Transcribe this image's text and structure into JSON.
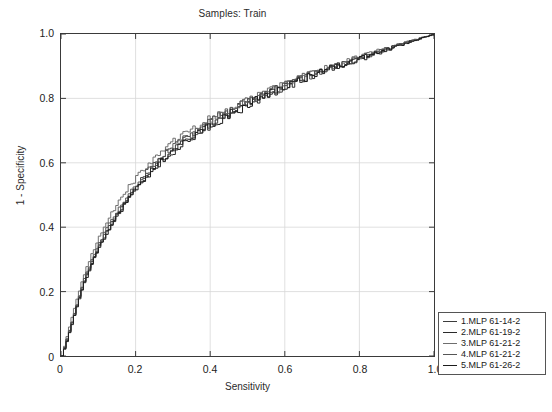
{
  "chart_data": {
    "type": "line",
    "title": "Samples: Train",
    "xlabel": "Sensitivity",
    "ylabel": "1 - Specificity",
    "xlim": [
      0,
      1
    ],
    "ylim": [
      0,
      1
    ],
    "grid": true,
    "legend_position": "right-bottom-outside",
    "xticks": [
      "0",
      "0.2",
      "0.4",
      "0.6",
      "0.8",
      "1.0"
    ],
    "xtick_values": [
      0,
      0.2,
      0.4,
      0.6,
      0.8,
      1.0
    ],
    "yticks": [
      "0",
      "0.2",
      "0.4",
      "0.6",
      "0.8",
      "1.0"
    ],
    "ytick_values": [
      0,
      0.2,
      0.4,
      0.6,
      0.8,
      1.0
    ],
    "x": [
      0,
      0.01,
      0.02,
      0.03,
      0.04,
      0.05,
      0.06,
      0.08,
      0.1,
      0.12,
      0.14,
      0.16,
      0.18,
      0.2,
      0.24,
      0.28,
      0.32,
      0.36,
      0.4,
      0.45,
      0.5,
      0.55,
      0.6,
      0.65,
      0.7,
      0.75,
      0.8,
      0.85,
      0.9,
      0.95,
      1.0
    ],
    "series": [
      {
        "name": "1.MLP 61-14-2",
        "color": "#3c3c3c",
        "values": [
          0,
          0.04,
          0.08,
          0.12,
          0.16,
          0.2,
          0.235,
          0.295,
          0.345,
          0.39,
          0.43,
          0.465,
          0.5,
          0.53,
          0.585,
          0.63,
          0.665,
          0.695,
          0.725,
          0.76,
          0.79,
          0.815,
          0.84,
          0.865,
          0.885,
          0.905,
          0.925,
          0.945,
          0.965,
          0.983,
          1.0
        ]
      },
      {
        "name": "2.MLP 61-19-2",
        "color": "#2a2a2a",
        "values": [
          0,
          0.035,
          0.075,
          0.115,
          0.155,
          0.195,
          0.23,
          0.29,
          0.34,
          0.385,
          0.425,
          0.46,
          0.495,
          0.525,
          0.575,
          0.62,
          0.655,
          0.69,
          0.72,
          0.755,
          0.785,
          0.812,
          0.838,
          0.862,
          0.884,
          0.904,
          0.924,
          0.944,
          0.964,
          0.982,
          1.0
        ]
      },
      {
        "name": "3.MLP 61-21-2",
        "color": "#6e6e6e",
        "values": [
          0,
          0.045,
          0.09,
          0.135,
          0.175,
          0.215,
          0.255,
          0.315,
          0.37,
          0.415,
          0.455,
          0.49,
          0.525,
          0.555,
          0.605,
          0.648,
          0.682,
          0.71,
          0.737,
          0.768,
          0.796,
          0.82,
          0.845,
          0.868,
          0.888,
          0.908,
          0.928,
          0.948,
          0.966,
          0.984,
          1.0
        ]
      },
      {
        "name": "4.MLP 61-21-2",
        "color": "#555555",
        "values": [
          0,
          0.038,
          0.078,
          0.118,
          0.158,
          0.198,
          0.238,
          0.298,
          0.35,
          0.395,
          0.435,
          0.47,
          0.505,
          0.535,
          0.588,
          0.632,
          0.668,
          0.698,
          0.728,
          0.762,
          0.792,
          0.817,
          0.842,
          0.866,
          0.886,
          0.906,
          0.926,
          0.946,
          0.965,
          0.983,
          1.0
        ]
      },
      {
        "name": "5.MLP 61-26-2",
        "color": "#1c1c1c",
        "values": [
          0,
          0.032,
          0.072,
          0.112,
          0.152,
          0.19,
          0.228,
          0.285,
          0.335,
          0.38,
          0.42,
          0.455,
          0.49,
          0.52,
          0.572,
          0.617,
          0.652,
          0.685,
          0.716,
          0.752,
          0.782,
          0.81,
          0.836,
          0.861,
          0.882,
          0.903,
          0.923,
          0.943,
          0.963,
          0.982,
          1.0
        ]
      }
    ]
  },
  "legend": {
    "entries": [
      {
        "label": "1.MLP 61-14-2",
        "color": "#3c3c3c"
      },
      {
        "label": "2.MLP 61-19-2",
        "color": "#2a2a2a"
      },
      {
        "label": "3.MLP 61-21-2",
        "color": "#6e6e6e"
      },
      {
        "label": "4.MLP 61-21-2",
        "color": "#555555"
      },
      {
        "label": "5.MLP 61-26-2",
        "color": "#1c1c1c"
      }
    ]
  },
  "style": {
    "frame_color": "#3a3a3a",
    "grid_color": "#d8d8d8",
    "text_color": "#1a1a1a",
    "background": "#ffffff"
  }
}
